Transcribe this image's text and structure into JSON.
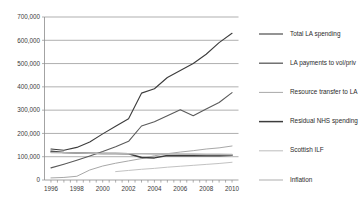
{
  "chart_data": {
    "type": "line",
    "title": "",
    "xlabel": "",
    "ylabel": "",
    "xlim": [
      1995.5,
      2010.5
    ],
    "ylim": [
      0,
      700000
    ],
    "grid": true,
    "legend_position": "right",
    "x": [
      1996,
      1997,
      1998,
      1999,
      2000,
      2001,
      2002,
      2003,
      2004,
      2005,
      2006,
      2007,
      2008,
      2009,
      2010
    ],
    "xtick_labels": [
      "1996",
      "1998",
      "2000",
      "2002",
      "2004",
      "2006",
      "2008",
      "2010"
    ],
    "xtick_values": [
      1996,
      1998,
      2000,
      2002,
      2004,
      2006,
      2008,
      2010
    ],
    "ytick_labels": [
      "0",
      "100,000",
      "200,000",
      "300,000",
      "400,000",
      "500,000",
      "600,000",
      "700,000"
    ],
    "ytick_values": [
      0,
      100000,
      200000,
      300000,
      400000,
      500000,
      600000,
      700000
    ],
    "series": [
      {
        "name": "Total LA spending",
        "color": "#3c3c3c",
        "width": 1.1,
        "x": [
          1996,
          1997,
          1998,
          1999,
          2000,
          2001,
          2002,
          2003,
          2004,
          2005,
          2006,
          2007,
          2008,
          2009,
          2010
        ],
        "values": [
          133000,
          128000,
          140000,
          163000,
          198000,
          231000,
          263000,
          373000,
          392000,
          440000,
          470000,
          500000,
          540000,
          590000,
          630000
        ]
      },
      {
        "name": "LA payments to vol/priv",
        "color": "#5a5a5a",
        "width": 1.1,
        "x": [
          1996,
          1997,
          1998,
          1999,
          2000,
          2001,
          2002,
          2003,
          2004,
          2005,
          2006,
          2007,
          2008,
          2009,
          2010
        ],
        "values": [
          52000,
          68000,
          85000,
          103000,
          122000,
          143000,
          166000,
          232000,
          250000,
          276000,
          302000,
          276000,
          305000,
          333000,
          375000
        ]
      },
      {
        "name": "Resource transfer to LA",
        "color": "#a8a8a8",
        "width": 1.0,
        "x": [
          1996,
          1997,
          1998,
          1999,
          2000,
          2001,
          2002,
          2003,
          2004,
          2005,
          2006,
          2007,
          2008,
          2009,
          2010
        ],
        "values": [
          9000,
          11000,
          16000,
          43000,
          60000,
          72000,
          82000,
          92000,
          104000,
          113000,
          120000,
          126000,
          133000,
          138000,
          146000
        ]
      },
      {
        "name": "Residual NHS spending",
        "color": "#3c3c3c",
        "width": 1.5,
        "x": [
          1996,
          1997,
          1998,
          1999,
          2000,
          2001,
          2002,
          2003,
          2004,
          2005,
          2006,
          2007,
          2008,
          2009,
          2010
        ],
        "values": [
          124000,
          118000,
          116000,
          115000,
          114000,
          114000,
          113000,
          97000,
          95000,
          105000,
          104000,
          104000,
          105000,
          104000,
          106000
        ]
      },
      {
        "name": "Scottish ILF",
        "color": "#c2c2c2",
        "width": 1.0,
        "x": [
          2001,
          2002,
          2003,
          2004,
          2005,
          2006,
          2007,
          2008,
          2009,
          2010
        ],
        "values": [
          36000,
          41000,
          46000,
          50000,
          55000,
          59000,
          63000,
          67000,
          71000,
          76000
        ]
      },
      {
        "name": "Inflation",
        "color": "#b5b5b5",
        "width": 1.6,
        "x": [
          1996,
          1997,
          1998,
          1999,
          2000,
          2001,
          2002,
          2003,
          2004,
          2005,
          2006,
          2007,
          2008,
          2009,
          2010
        ],
        "values": [
          118000,
          117000,
          116000,
          115000,
          114000,
          114000,
          113000,
          113000,
          112000,
          112000,
          111000,
          111000,
          110000,
          110000,
          109000
        ]
      }
    ]
  },
  "legend": {
    "items": [
      {
        "label": "Total LA spending",
        "color": "#3c3c3c",
        "width": 1.1
      },
      {
        "label": "LA payments to vol/priv",
        "color": "#5a5a5a",
        "width": 1.3
      },
      {
        "label": "Resource transfer to LA",
        "color": "#a8a8a8",
        "width": 1.0
      },
      {
        "label": "Residual NHS spending",
        "color": "#3c3c3c",
        "width": 1.5
      },
      {
        "label": "Scottish ILF",
        "color": "#c2c2c2",
        "width": 1.1
      },
      {
        "label": "Inflation",
        "color": "#b5b5b5",
        "width": 1.1
      }
    ]
  }
}
